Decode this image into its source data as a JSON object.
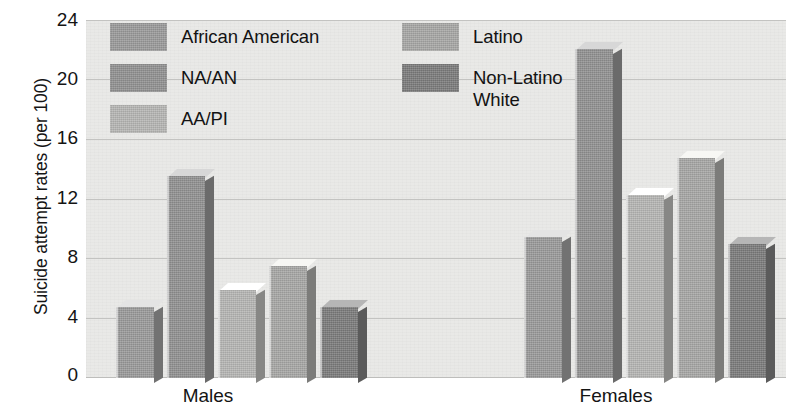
{
  "chart_data": {
    "type": "bar",
    "title": "",
    "subtitle": "",
    "xlabel": "",
    "ylabel": "Suicide attempt rates (per 100)",
    "categories": [
      "Males",
      "Females"
    ],
    "ylim": [
      0,
      24
    ],
    "yticks": [
      0,
      4,
      8,
      12,
      16,
      20,
      24
    ],
    "grid": true,
    "legend_position": "top-left-inside",
    "series": [
      {
        "name": "African American",
        "color": "#9a9a9a",
        "values": [
          4.8,
          9.5
        ]
      },
      {
        "name": "NA/AN",
        "color": "#919191",
        "values": [
          13.6,
          22.1
        ]
      },
      {
        "name": "AA/PI",
        "color": "#b6b6b4",
        "values": [
          5.9,
          12.3
        ]
      },
      {
        "name": "Latino",
        "color": "#a7a7a5",
        "values": [
          7.5,
          14.8
        ]
      },
      {
        "name": "Non-Latino White",
        "color": "#7b7b7b",
        "values": [
          4.8,
          9.0
        ]
      }
    ]
  },
  "axes": {
    "y_title": "Suicide attempt rates (per 100)",
    "y_tick_labels": [
      "24",
      "20",
      "16",
      "12",
      "8",
      "4",
      "0"
    ],
    "x_tick_labels": [
      "Males",
      "Females"
    ]
  },
  "legend": {
    "column_left": [
      {
        "label": "African American",
        "color": "#9a9a9a"
      },
      {
        "label": "NA/AN",
        "color": "#919191"
      },
      {
        "label": "AA/PI",
        "color": "#b6b6b4"
      }
    ],
    "column_right": [
      {
        "label": "Latino",
        "color": "#a7a7a5"
      },
      {
        "label": "Non-Latino\nWhite",
        "color": "#7b7b7b"
      }
    ]
  },
  "style": {
    "plot_background": "#e9e9e7",
    "gridline_color": "#c3c3c1",
    "text_color": "#141414"
  }
}
